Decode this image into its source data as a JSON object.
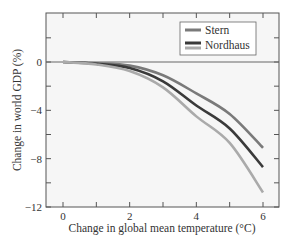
{
  "chart_data": {
    "type": "line",
    "title": "",
    "xlabel": "Change in global mean temperature (°C)",
    "ylabel": "Change in world GDP (%)",
    "xlim": [
      -0.5,
      6.5
    ],
    "ylim": [
      -12,
      4
    ],
    "x_ticks": [
      0,
      2,
      4,
      6
    ],
    "x_tick_labels": [
      "0",
      "2",
      "4",
      "6"
    ],
    "x_minor_ticks": [
      1,
      3,
      5
    ],
    "y_ticks": [
      0,
      -4,
      -8,
      -12
    ],
    "y_tick_labels": [
      "0",
      "-4",
      "-8",
      "-12"
    ],
    "y_minor_ticks": [
      2,
      -2,
      -6,
      -10
    ],
    "grid": false,
    "zero_line": true,
    "legend_position": "upper right",
    "legend": [
      {
        "label": "Stern",
        "swatches": [
          "#7a7a7a"
        ]
      },
      {
        "label": "Nordhaus",
        "swatches": [
          "#3a3a3a",
          "#aaaaaa"
        ]
      }
    ],
    "x": [
      0,
      1,
      2,
      3,
      4,
      5,
      6
    ],
    "series": [
      {
        "name": "Stern",
        "color": "#7a7a7a",
        "values": [
          0,
          -0.1,
          -0.3,
          -1.1,
          -2.6,
          -4.3,
          -7.1
        ]
      },
      {
        "name": "Nordhaus (dark)",
        "color": "#3a3a3a",
        "values": [
          0,
          -0.15,
          -0.5,
          -1.6,
          -3.6,
          -5.5,
          -8.7
        ]
      },
      {
        "name": "Nordhaus (light)",
        "color": "#aaaaaa",
        "values": [
          0,
          -0.2,
          -0.75,
          -2.1,
          -4.5,
          -6.7,
          -10.8
        ]
      }
    ]
  },
  "colors": {
    "plot_background": "#f6f6f6",
    "axis": "#555555",
    "zero_line": "#666666"
  }
}
